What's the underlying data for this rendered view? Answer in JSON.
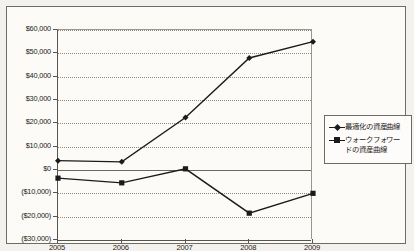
{
  "chart_data": {
    "type": "line",
    "title": "",
    "xlabel": "",
    "ylabel": "",
    "categories": [
      "2005",
      "2006",
      "2007",
      "2008",
      "2009"
    ],
    "ylim": [
      -30000,
      60000
    ],
    "ytick_values": [
      60000,
      50000,
      40000,
      30000,
      20000,
      10000,
      0,
      -10000,
      -20000,
      -30000
    ],
    "ytick_labels": [
      "$60,000",
      "$50,000",
      "$40,000",
      "$30,000",
      "$20,000",
      "$10,000",
      "$0",
      "($10,000)",
      "($20,000)",
      "($30,000)"
    ],
    "grid": true,
    "legend_position": "right",
    "series": [
      {
        "name": "最適化の資産曲線",
        "marker": "diamond",
        "values": [
          4000,
          3500,
          22500,
          48000,
          55000
        ]
      },
      {
        "name": "ウォークフォワードの資産曲線",
        "marker": "square",
        "values": [
          -3500,
          -5500,
          500,
          -18500,
          -10000
        ]
      }
    ]
  },
  "legend": {
    "items": [
      {
        "label": "最適化の資産曲線",
        "marker": "diamond"
      },
      {
        "label": "ウォークフォワードの資産曲線",
        "marker": "square"
      }
    ]
  },
  "axis": {
    "y_labels": [
      "$60,000",
      "$50,000",
      "$40,000",
      "$30,000",
      "$20,000",
      "$10,000",
      "$0",
      "($10,000)",
      "($20,000)",
      "($30,000)"
    ],
    "x_labels": [
      "2005",
      "2006",
      "2007",
      "2008",
      "2009"
    ]
  },
  "colors": {
    "series_line": "#1d1b19",
    "grid": "#8d8981",
    "axis": "#58544e",
    "background": "#fcfbf8",
    "frame": "#6e6a64"
  }
}
